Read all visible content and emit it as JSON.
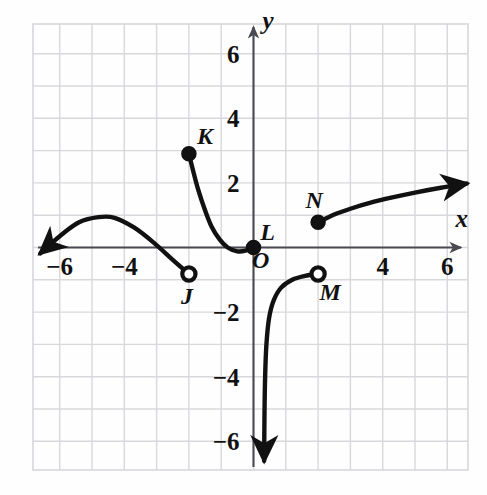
{
  "figure": {
    "background_color": "#fefefe",
    "grid_color": "#d8d8dc",
    "axis_color": "#4a4a52",
    "curve_color": "#111111"
  },
  "chart_data": {
    "type": "line",
    "title": "",
    "xlabel": "x",
    "ylabel": "y",
    "xlim": [
      -7.2,
      7.0
    ],
    "ylim": [
      -7.2,
      7.2
    ],
    "grid": true,
    "legend": "none",
    "x_ticks": [
      -6,
      -4,
      4,
      6
    ],
    "x_tick_labels": [
      "−6",
      "−4",
      "4",
      "6"
    ],
    "y_ticks": [
      6,
      4,
      2,
      -2,
      -4,
      -6
    ],
    "y_tick_labels": [
      "6",
      "4",
      "2",
      "−2",
      "−4",
      "−6"
    ],
    "origin_label": "O",
    "series": [
      {
        "name": "branch-left-cubic",
        "description": "Rises from lower-left arrow, crests near (-4.5, 1), falls to open endpoint J",
        "arrow_start": true,
        "arrow_end": false,
        "points": [
          [
            -6.6,
            -0.18
          ],
          [
            -6.0,
            0.35
          ],
          [
            -5.4,
            0.78
          ],
          [
            -4.8,
            0.94
          ],
          [
            -4.3,
            0.92
          ],
          [
            -3.7,
            0.62
          ],
          [
            -3.1,
            0.16
          ],
          [
            -2.5,
            -0.38
          ],
          [
            -2.0,
            -0.82
          ]
        ],
        "endpoint": {
          "label": "J",
          "x": -2.0,
          "y": -0.82,
          "filled": false
        }
      },
      {
        "name": "branch-decreasing-to-L",
        "description": "Falls steeply from closed endpoint K, flattens and reaches closed endpoint L at the origin",
        "arrow_start": false,
        "arrow_end": false,
        "points": [
          [
            -2.0,
            2.9
          ],
          [
            -1.85,
            2.3
          ],
          [
            -1.7,
            1.75
          ],
          [
            -1.5,
            1.15
          ],
          [
            -1.3,
            0.65
          ],
          [
            -1.05,
            0.25
          ],
          [
            -0.8,
            0.0
          ],
          [
            -0.5,
            -0.12
          ],
          [
            -0.25,
            -0.1
          ],
          [
            0.0,
            0.0
          ]
        ],
        "endpoints": [
          {
            "label": "K",
            "x": -2.0,
            "y": 2.9,
            "filled": true
          },
          {
            "label": "L",
            "x": 0.0,
            "y": 0.0,
            "filled": true
          }
        ]
      },
      {
        "name": "branch-asymptotic-to-M",
        "description": "Rises from a downward arrow along a near-vertical asymptote just right of the y-axis to open endpoint M",
        "arrow_start": true,
        "arrow_end": false,
        "points": [
          [
            0.33,
            -6.6
          ],
          [
            0.34,
            -5.2
          ],
          [
            0.36,
            -4.0
          ],
          [
            0.4,
            -3.0
          ],
          [
            0.48,
            -2.2
          ],
          [
            0.62,
            -1.65
          ],
          [
            0.85,
            -1.25
          ],
          [
            1.2,
            -1.0
          ],
          [
            1.6,
            -0.88
          ],
          [
            2.0,
            -0.82
          ]
        ],
        "endpoint": {
          "label": "M",
          "x": 2.0,
          "y": -0.82,
          "filled": false
        }
      },
      {
        "name": "branch-radical-from-N",
        "description": "Rises gradually from closed endpoint N toward an arrow at the upper right",
        "arrow_start": false,
        "arrow_end": true,
        "points": [
          [
            2.0,
            0.78
          ],
          [
            2.5,
            1.02
          ],
          [
            3.0,
            1.2
          ],
          [
            3.6,
            1.38
          ],
          [
            4.3,
            1.55
          ],
          [
            5.0,
            1.7
          ],
          [
            5.8,
            1.85
          ],
          [
            6.6,
            1.98
          ]
        ],
        "endpoint": {
          "label": "N",
          "x": 2.0,
          "y": 0.78,
          "filled": true
        }
      }
    ],
    "labeled_points": [
      {
        "label": "J",
        "x": -2.0,
        "y": -0.82,
        "filled": false,
        "label_dx": -2,
        "label_dy": 30
      },
      {
        "label": "K",
        "x": -2.0,
        "y": 2.9,
        "filled": true,
        "label_dx": 16,
        "label_dy": -10
      },
      {
        "label": "L",
        "x": 0.0,
        "y": 0.0,
        "filled": true,
        "label_dx": 14,
        "label_dy": -8
      },
      {
        "label": "M",
        "x": 2.0,
        "y": -0.82,
        "filled": false,
        "label_dx": 12,
        "label_dy": 26
      },
      {
        "label": "N",
        "x": 2.0,
        "y": 0.78,
        "filled": true,
        "label_dx": -4,
        "label_dy": -14
      }
    ],
    "annotations": [
      {
        "text": "x",
        "role": "x-axis-label",
        "x": 6.45,
        "y": 0.62
      },
      {
        "text": "y",
        "role": "y-axis-label",
        "x": 0.45,
        "y": 6.75
      },
      {
        "text": "O",
        "role": "origin-label",
        "x": 0.22,
        "y": -0.62
      }
    ]
  }
}
